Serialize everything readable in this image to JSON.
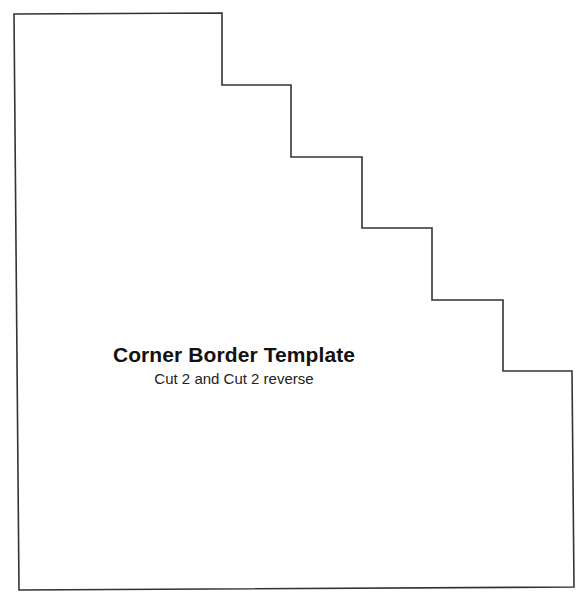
{
  "template": {
    "title": "Corner Border Template",
    "subtitle": "Cut 2 and Cut 2 reverse",
    "outline_color": "#333333",
    "outline_points": [
      [
        14,
        14
      ],
      [
        222,
        13
      ],
      [
        222,
        85
      ],
      [
        291,
        85
      ],
      [
        291,
        157
      ],
      [
        362,
        157
      ],
      [
        362,
        228
      ],
      [
        432,
        228
      ],
      [
        432,
        300
      ],
      [
        503,
        300
      ],
      [
        503,
        371
      ],
      [
        572,
        371
      ],
      [
        574,
        587
      ],
      [
        19,
        590
      ]
    ]
  }
}
